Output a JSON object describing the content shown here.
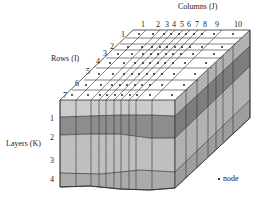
{
  "diagram": {
    "type": "finite-difference grid block diagram",
    "axes": {
      "columns": {
        "label": "Columns (J)",
        "ticks": [
          "1",
          "2",
          "3",
          "4",
          "5",
          "6",
          "7",
          "8",
          "9",
          "10"
        ]
      },
      "rows": {
        "label": "Rows (I)",
        "ticks": [
          "1",
          "2",
          "3",
          "4",
          "5",
          "6",
          "7"
        ]
      },
      "layers": {
        "label": "Layers (K)",
        "ticks": [
          "1",
          "2",
          "3",
          "4"
        ]
      }
    },
    "legend": {
      "symbol": "•",
      "label": "node"
    },
    "colors": {
      "top_face": "#ffffff",
      "layer1": "#c8c8c8",
      "layer2": "#8a8a8a",
      "layer3": "#bdbdbd",
      "layer4": "#a9a9a9",
      "line": "#333333"
    }
  }
}
